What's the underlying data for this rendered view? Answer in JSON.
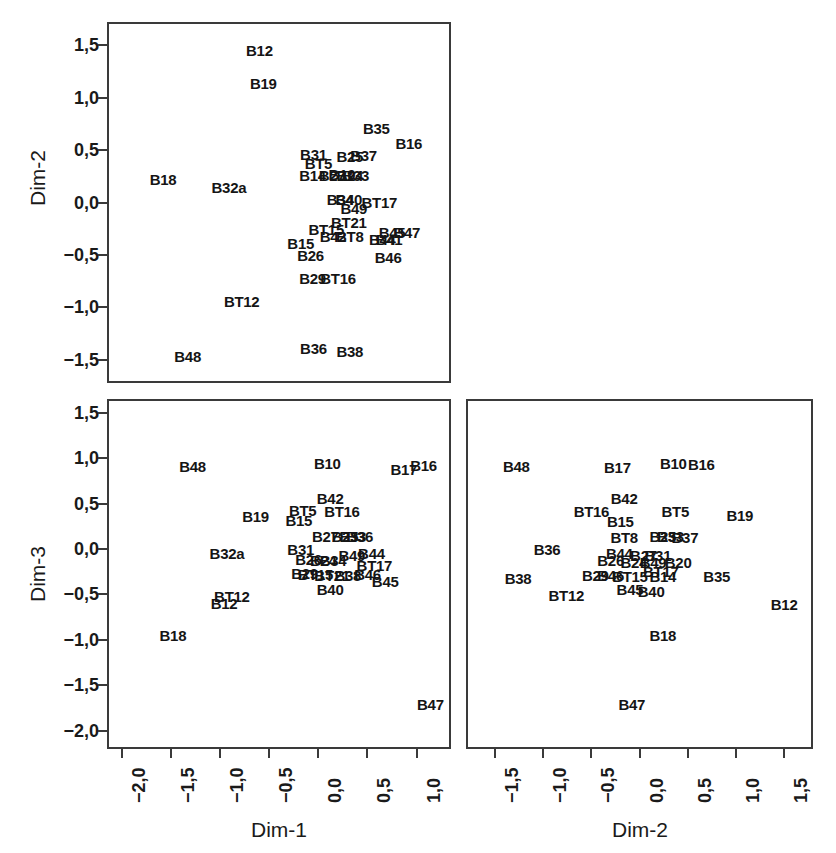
{
  "figure": {
    "kind": "scatterplot-matrix",
    "background_color": "#ffffff",
    "ink_color": "#1a1a1a",
    "axis_color": "#3a3a3a",
    "decimal_separator": ","
  },
  "chart_data": [
    {
      "id": "dim1-dim2",
      "type": "scatter",
      "title": "",
      "xlabel": "",
      "ylabel": "Dim-2",
      "xlim": [
        -2.15,
        1.35
      ],
      "ylim": [
        -1.72,
        1.72
      ],
      "grid": false,
      "legend": "none",
      "marker": "text-label",
      "xticks_visible": false,
      "yticks": [
        "1,5",
        "1,0",
        "0,5",
        "0,0",
        "-0,5",
        "-1,0",
        "-1,5"
      ],
      "ytick_values": [
        1.5,
        1.0,
        0.5,
        0.0,
        -0.5,
        -1.0,
        -1.5
      ],
      "points": [
        {
          "label": "B12",
          "x": -0.62,
          "y": 1.47
        },
        {
          "label": "B19",
          "x": -0.58,
          "y": 1.16
        },
        {
          "label": "B35",
          "x": 0.57,
          "y": 0.73
        },
        {
          "label": "B16",
          "x": 0.9,
          "y": 0.59
        },
        {
          "label": "B31",
          "x": -0.07,
          "y": 0.48
        },
        {
          "label": "B25",
          "x": 0.3,
          "y": 0.46
        },
        {
          "label": "B37",
          "x": 0.44,
          "y": 0.47
        },
        {
          "label": "BT5",
          "x": -0.02,
          "y": 0.4
        },
        {
          "label": "B14",
          "x": -0.08,
          "y": 0.28
        },
        {
          "label": "B27",
          "x": 0.12,
          "y": 0.28
        },
        {
          "label": "B10",
          "x": 0.22,
          "y": 0.29
        },
        {
          "label": "B24",
          "x": 0.3,
          "y": 0.28
        },
        {
          "label": "B33",
          "x": 0.36,
          "y": 0.28
        },
        {
          "label": "B32a",
          "x": -0.93,
          "y": 0.17
        },
        {
          "label": "B34",
          "x": 0.2,
          "y": 0.05
        },
        {
          "label": "B40",
          "x": 0.29,
          "y": 0.05
        },
        {
          "label": "BT17",
          "x": 0.6,
          "y": 0.02
        },
        {
          "label": "B49",
          "x": 0.34,
          "y": -0.03
        },
        {
          "label": "B18",
          "x": -1.6,
          "y": 0.24
        },
        {
          "label": "BT21",
          "x": 0.29,
          "y": -0.17
        },
        {
          "label": "BT15",
          "x": 0.06,
          "y": -0.23
        },
        {
          "label": "B42",
          "x": 0.13,
          "y": -0.3
        },
        {
          "label": "BT8",
          "x": 0.3,
          "y": -0.3
        },
        {
          "label": "B45",
          "x": 0.73,
          "y": -0.26
        },
        {
          "label": "B47",
          "x": 0.88,
          "y": -0.26
        },
        {
          "label": "B44",
          "x": 0.63,
          "y": -0.33
        },
        {
          "label": "B41",
          "x": 0.7,
          "y": -0.33
        },
        {
          "label": "B15",
          "x": -0.2,
          "y": -0.37
        },
        {
          "label": "B26",
          "x": -0.1,
          "y": -0.48
        },
        {
          "label": "B46",
          "x": 0.69,
          "y": -0.5
        },
        {
          "label": "B29",
          "x": -0.08,
          "y": -0.7
        },
        {
          "label": "BT16",
          "x": 0.18,
          "y": -0.7
        },
        {
          "label": "BT12",
          "x": -0.8,
          "y": -0.92
        },
        {
          "label": "B36",
          "x": -0.07,
          "y": -1.37
        },
        {
          "label": "B38",
          "x": 0.3,
          "y": -1.4
        },
        {
          "label": "B48",
          "x": -1.35,
          "y": -1.44
        }
      ]
    },
    {
      "id": "dim1-dim3",
      "type": "scatter",
      "title": "",
      "xlabel": "Dim-1",
      "ylabel": "Dim-3",
      "xlim": [
        -2.15,
        1.35
      ],
      "ylim": [
        -2.2,
        1.65
      ],
      "grid": false,
      "legend": "none",
      "marker": "text-label",
      "xticks": [
        "-2,0",
        "-1,5",
        "-1,0",
        "-0,5",
        "0,0",
        "0,5",
        "1,0"
      ],
      "xtick_values": [
        -2.0,
        -1.5,
        -1.0,
        -0.5,
        0.0,
        0.5,
        1.0
      ],
      "yticks": [
        "1,5",
        "1,0",
        "0,5",
        "0,0",
        "-0,5",
        "-1,0",
        "-1,5",
        "-2,0"
      ],
      "ytick_values": [
        1.5,
        1.0,
        0.5,
        0.0,
        -0.5,
        -1.0,
        -1.5,
        -2.0
      ],
      "points": [
        {
          "label": "B48",
          "x": -1.3,
          "y": 0.93
        },
        {
          "label": "B10",
          "x": 0.07,
          "y": 0.97
        },
        {
          "label": "B17",
          "x": 0.85,
          "y": 0.9
        },
        {
          "label": "B16",
          "x": 1.05,
          "y": 0.95
        },
        {
          "label": "B42",
          "x": 0.1,
          "y": 0.58
        },
        {
          "label": "BT5",
          "x": -0.18,
          "y": 0.45
        },
        {
          "label": "BT16",
          "x": 0.22,
          "y": 0.44
        },
        {
          "label": "B19",
          "x": -0.66,
          "y": 0.38
        },
        {
          "label": "B15",
          "x": -0.22,
          "y": 0.34
        },
        {
          "label": "B27",
          "x": 0.05,
          "y": 0.16
        },
        {
          "label": "B25",
          "x": 0.25,
          "y": 0.17
        },
        {
          "label": "B33",
          "x": 0.33,
          "y": 0.17
        },
        {
          "label": "B36",
          "x": 0.4,
          "y": 0.17
        },
        {
          "label": "B31",
          "x": -0.2,
          "y": 0.02
        },
        {
          "label": "B32a",
          "x": -0.95,
          "y": -0.02
        },
        {
          "label": "B49",
          "x": 0.32,
          "y": -0.04
        },
        {
          "label": "B44",
          "x": 0.52,
          "y": -0.02
        },
        {
          "label": "B26",
          "x": -0.12,
          "y": -0.09
        },
        {
          "label": "B24",
          "x": 0.03,
          "y": -0.1
        },
        {
          "label": "B34",
          "x": 0.13,
          "y": -0.1
        },
        {
          "label": "BT17",
          "x": 0.55,
          "y": -0.15
        },
        {
          "label": "B29",
          "x": -0.16,
          "y": -0.24
        },
        {
          "label": "BT15",
          "x": -0.05,
          "y": -0.25
        },
        {
          "label": "BT21",
          "x": 0.12,
          "y": -0.26
        },
        {
          "label": "B38",
          "x": 0.28,
          "y": -0.26
        },
        {
          "label": "B46",
          "x": 0.48,
          "y": -0.25
        },
        {
          "label": "B45",
          "x": 0.66,
          "y": -0.33
        },
        {
          "label": "B40",
          "x": 0.1,
          "y": -0.42
        },
        {
          "label": "BT12",
          "x": -0.9,
          "y": -0.5
        },
        {
          "label": "B12",
          "x": -0.98,
          "y": -0.57
        },
        {
          "label": "B18",
          "x": -1.5,
          "y": -0.92
        },
        {
          "label": "B47",
          "x": 1.12,
          "y": -1.68
        }
      ]
    },
    {
      "id": "dim2-dim3",
      "type": "scatter",
      "title": "",
      "xlabel": "Dim-2",
      "ylabel": "",
      "xlim": [
        -1.8,
        1.8
      ],
      "ylim": [
        -2.2,
        1.65
      ],
      "grid": false,
      "legend": "none",
      "marker": "text-label",
      "xticks": [
        "-1,5",
        "-1,0",
        "-0,5",
        "0,0",
        "0,5",
        "1,0",
        "1,5"
      ],
      "xtick_values": [
        -1.5,
        -1.0,
        -0.5,
        0.0,
        0.5,
        1.0,
        1.5
      ],
      "yticks_visible": false,
      "points": [
        {
          "label": "B48",
          "x": -1.3,
          "y": 0.93
        },
        {
          "label": "B17",
          "x": -0.25,
          "y": 0.92
        },
        {
          "label": "B10",
          "x": 0.33,
          "y": 0.97
        },
        {
          "label": "B16",
          "x": 0.62,
          "y": 0.96
        },
        {
          "label": "B42",
          "x": -0.18,
          "y": 0.58
        },
        {
          "label": "BT16",
          "x": -0.52,
          "y": 0.44
        },
        {
          "label": "BT5",
          "x": 0.35,
          "y": 0.44
        },
        {
          "label": "B19",
          "x": 1.02,
          "y": 0.4
        },
        {
          "label": "B15",
          "x": -0.22,
          "y": 0.33
        },
        {
          "label": "BT8",
          "x": -0.18,
          "y": 0.15
        },
        {
          "label": "B25",
          "x": 0.22,
          "y": 0.17
        },
        {
          "label": "B33",
          "x": 0.3,
          "y": 0.17
        },
        {
          "label": "B37",
          "x": 0.45,
          "y": 0.15
        },
        {
          "label": "B36",
          "x": -0.98,
          "y": 0.02
        },
        {
          "label": "B44",
          "x": -0.23,
          "y": -0.02
        },
        {
          "label": "B27",
          "x": 0.02,
          "y": -0.04
        },
        {
          "label": "B31",
          "x": 0.17,
          "y": -0.04
        },
        {
          "label": "B26",
          "x": -0.32,
          "y": -0.1
        },
        {
          "label": "B24",
          "x": -0.08,
          "y": -0.12
        },
        {
          "label": "B49",
          "x": 0.12,
          "y": -0.12
        },
        {
          "label": "B20",
          "x": 0.38,
          "y": -0.12
        },
        {
          "label": "BT17",
          "x": 0.2,
          "y": -0.22
        },
        {
          "label": "B29",
          "x": -0.48,
          "y": -0.26
        },
        {
          "label": "B46",
          "x": -0.32,
          "y": -0.26
        },
        {
          "label": "BT15",
          "x": -0.12,
          "y": -0.27
        },
        {
          "label": "B14",
          "x": 0.22,
          "y": -0.27
        },
        {
          "label": "B38",
          "x": -1.28,
          "y": -0.3
        },
        {
          "label": "B35",
          "x": 0.78,
          "y": -0.28
        },
        {
          "label": "B45",
          "x": -0.12,
          "y": -0.42
        },
        {
          "label": "B40",
          "x": 0.1,
          "y": -0.44
        },
        {
          "label": "BT12",
          "x": -0.78,
          "y": -0.48
        },
        {
          "label": "B12",
          "x": 1.48,
          "y": -0.58
        },
        {
          "label": "B18",
          "x": 0.22,
          "y": -0.92
        },
        {
          "label": "B47",
          "x": -0.1,
          "y": -1.68
        }
      ]
    }
  ]
}
